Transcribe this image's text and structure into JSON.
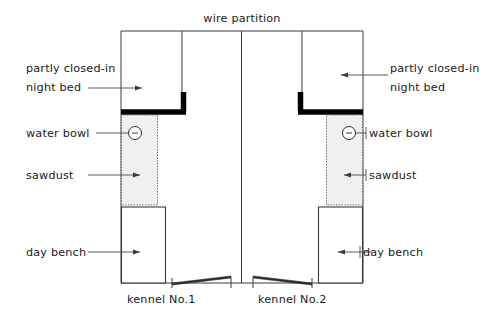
{
  "diagram": {
    "title": "wire partition",
    "labels": {
      "night_bed_left": "partly closed-in",
      "night_bed_left_2": "night bed",
      "night_bed_right": "partly closed-in",
      "night_bed_right_2": "night bed",
      "water_bowl_left": "water bowl",
      "water_bowl_right": "water bowl",
      "sawdust_left": "sawdust",
      "sawdust_right": "sawdust",
      "day_bench_left": "day bench",
      "day_bench_right": "day bench",
      "kennel_left": "kennel No.1",
      "kennel_right": "kennel No.2"
    },
    "colors": {
      "line": "#3a3a3a",
      "thick_wall": "#000000",
      "sawdust_fill": "#f0f0f0",
      "text": "#1a1a1a",
      "background": "#ffffff"
    }
  }
}
